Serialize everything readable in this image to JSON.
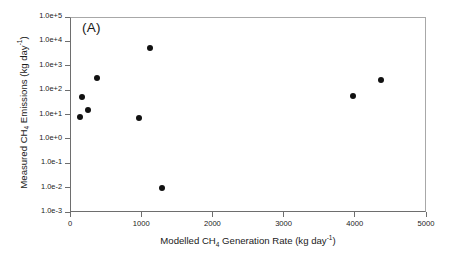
{
  "panel": {
    "label": "(A)"
  },
  "axes": {
    "x": {
      "title_prefix": "Modelled CH",
      "title_sub": "4",
      "title_mid": " Generation Rate (kg day",
      "title_sup": "-1",
      "title_suffix": ")",
      "title_full": "Modelled CH4 Generation Rate (kg day-1)",
      "ticks": [
        "0",
        "1000",
        "2000",
        "3000",
        "4000",
        "5000"
      ],
      "tick_values": [
        0,
        1000,
        2000,
        3000,
        4000,
        5000
      ],
      "min": 0,
      "max": 5000,
      "scale": "linear"
    },
    "y": {
      "title_prefix": "Measured CH",
      "title_sub": "4",
      "title_mid": " Emissions (kg day",
      "title_sup": "-1",
      "title_suffix": ")",
      "title_full": "Measured CH4 Emissions (kg day-1)",
      "ticks": [
        "1.0e+5",
        "1.0e+4",
        "1.0e+3",
        "1.0e+2",
        "1.0e+1",
        "1.0e+0",
        "1.0e-1",
        "1.0e-2",
        "1.0e-3"
      ],
      "tick_values": [
        100000,
        10000,
        1000,
        100,
        10,
        1,
        0.1,
        0.01,
        0.001
      ],
      "min": 0.001,
      "max": 100000,
      "scale": "log"
    }
  },
  "style": {
    "marker_color": "#111111",
    "axis_color": "#6e6e6e",
    "background": "#ffffff"
  },
  "chart_data": {
    "type": "scatter",
    "title": "(A)",
    "xlabel": "Modelled CH4 Generation Rate (kg day-1)",
    "ylabel": "Measured CH4 Emissions (kg day-1)",
    "xlim": [
      0,
      5000
    ],
    "ylim": [
      0.001,
      100000
    ],
    "xscale": "linear",
    "yscale": "log",
    "grid": false,
    "legend": null,
    "series": [
      {
        "name": "Landfill sites",
        "marker": "filled-circle",
        "color": "#111111",
        "points": [
          {
            "x": 140,
            "y": 8
          },
          {
            "x": 170,
            "y": 50
          },
          {
            "x": 250,
            "y": 15
          },
          {
            "x": 380,
            "y": 300
          },
          {
            "x": 970,
            "y": 7
          },
          {
            "x": 1120,
            "y": 5500
          },
          {
            "x": 1290,
            "y": 0.01
          },
          {
            "x": 3970,
            "y": 60
          },
          {
            "x": 4370,
            "y": 250
          }
        ]
      }
    ]
  }
}
